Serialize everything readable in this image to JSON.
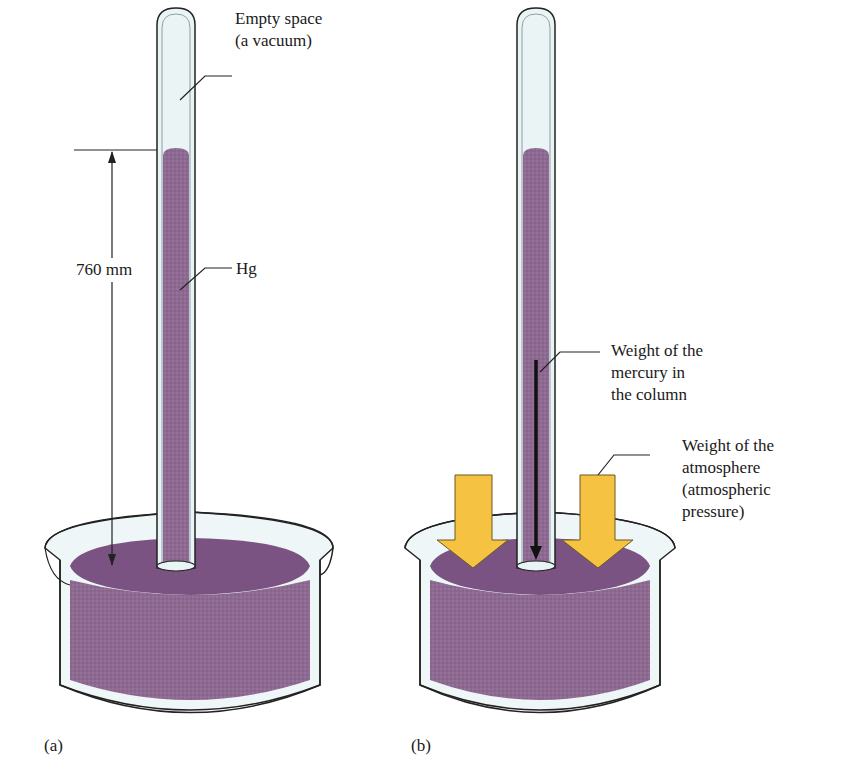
{
  "figure": {
    "panel_a": {
      "label": "(a)",
      "vacuum_label_line1": "Empty space",
      "vacuum_label_line2": "(a vacuum)",
      "height_label": "760 mm",
      "mercury_label": "Hg"
    },
    "panel_b": {
      "label": "(b)",
      "column_weight_line1": "Weight of the",
      "column_weight_line2": "mercury in",
      "column_weight_line3": "the column",
      "atmosphere_line1": "Weight of the",
      "atmosphere_line2": "atmosphere",
      "atmosphere_line3": "(atmospheric",
      "atmosphere_line4": "pressure)"
    },
    "colors": {
      "mercury": "#8e6a92",
      "mercury_surface": "#7a5382",
      "glass": "#eaf4f5",
      "arrow_yellow": "#f5c242",
      "outline": "#222222"
    }
  }
}
